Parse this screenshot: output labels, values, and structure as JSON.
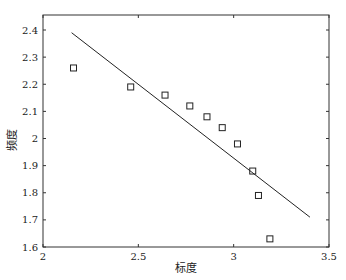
{
  "chart_data": {
    "type": "scatter",
    "title": "",
    "xlabel": "标度",
    "ylabel": "频度",
    "xlim": [
      2,
      3.5
    ],
    "ylim": [
      1.6,
      2.45
    ],
    "grid": false,
    "legend": null,
    "x_ticks": [
      2,
      2.5,
      3,
      3.5
    ],
    "x_tick_labels": [
      "2",
      "2.5",
      "3",
      "3.5"
    ],
    "y_ticks": [
      1.6,
      1.7,
      1.8,
      1.9,
      2.0,
      2.1,
      2.2,
      2.3,
      2.4
    ],
    "y_tick_labels": [
      "1.6",
      "1.7",
      "1.8",
      "1.9",
      "2",
      "2.1",
      "2.2",
      "2.3",
      "2.4"
    ],
    "series": [
      {
        "name": "data",
        "marker": "square",
        "x": [
          2.16,
          2.46,
          2.64,
          2.77,
          2.86,
          2.94,
          3.02,
          3.1,
          3.13,
          3.19
        ],
        "y": [
          2.26,
          2.19,
          2.16,
          2.12,
          2.08,
          2.04,
          1.98,
          1.88,
          1.79,
          1.63
        ]
      },
      {
        "name": "fit",
        "type": "line",
        "x": [
          2.15,
          3.4
        ],
        "y": [
          2.39,
          1.71
        ]
      }
    ]
  }
}
